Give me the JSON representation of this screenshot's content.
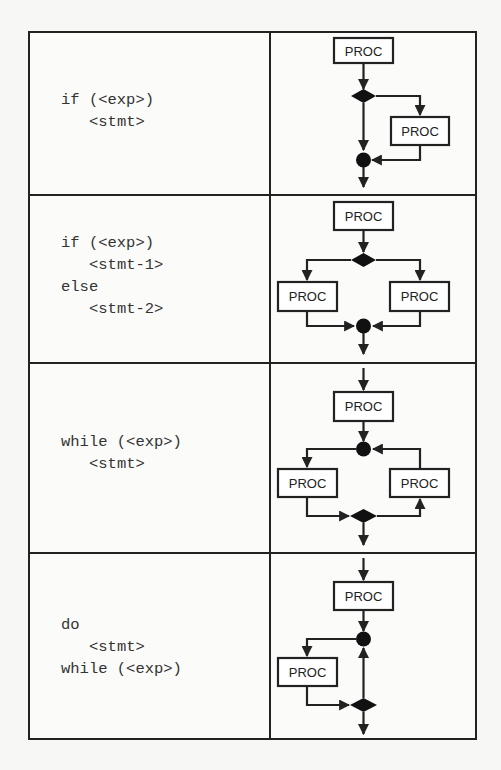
{
  "figure": {
    "rows": [
      {
        "name": "if",
        "code_lines": [
          {
            "text": "if (<exp>)",
            "indent": false
          },
          {
            "text": "<stmt>",
            "indent": true
          }
        ],
        "flowchart": {
          "nodes": [
            "PROC",
            "decision-diamond",
            "PROC (true branch)",
            "merge-circle"
          ],
          "box_label": "PROC"
        }
      },
      {
        "name": "if-else",
        "code_lines": [
          {
            "text": "if (<exp>)",
            "indent": false
          },
          {
            "text": "<stmt-1>",
            "indent": true
          },
          {
            "text": "else",
            "indent": false
          },
          {
            "text": "<stmt-2>",
            "indent": true
          }
        ],
        "flowchart": {
          "nodes": [
            "PROC",
            "decision-diamond",
            "PROC (left)",
            "PROC (right)",
            "merge-circle"
          ],
          "box_label": "PROC"
        }
      },
      {
        "name": "while",
        "code_lines": [
          {
            "text": "while (<exp>)",
            "indent": false
          },
          {
            "text": "<stmt>",
            "indent": true
          }
        ],
        "flowchart": {
          "nodes": [
            "PROC",
            "merge-circle",
            "PROC (left)",
            "PROC (right/loop back)",
            "decision-diamond"
          ],
          "box_label": "PROC"
        }
      },
      {
        "name": "do-while",
        "code_lines": [
          {
            "text": "do",
            "indent": false
          },
          {
            "text": "<stmt>",
            "indent": true
          },
          {
            "text": "while (<exp>)",
            "indent": false
          }
        ],
        "flowchart": {
          "nodes": [
            "PROC",
            "merge-circle",
            "PROC (left)",
            "decision-diamond"
          ],
          "box_label": "PROC"
        }
      }
    ],
    "box_label": "PROC",
    "colors": {
      "ink": "#222222",
      "paper": "#fbfbfa"
    }
  }
}
